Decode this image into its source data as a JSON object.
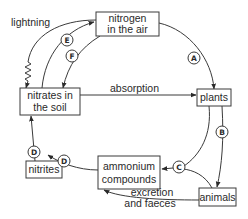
{
  "nodes": {
    "nitrogen_air": {
      "line1": "nitrogen",
      "line2": "in the air"
    },
    "nitrates_soil": {
      "line1": "nitrates in",
      "line2": "the soil"
    },
    "plants": {
      "label": "plants"
    },
    "nitrites": {
      "label": "nitrites"
    },
    "ammonium": {
      "line1": "ammonium",
      "line2": "compounds"
    },
    "animals": {
      "label": "animals"
    }
  },
  "edge_labels": {
    "lightning": "lightning",
    "absorption": "absorption",
    "excretion_line1": "excretion",
    "excretion_line2": "and faeces"
  },
  "process_markers": {
    "A": "A",
    "B": "B",
    "C": "C",
    "D1": "D",
    "D2": "D",
    "E": "E",
    "F": "F"
  }
}
